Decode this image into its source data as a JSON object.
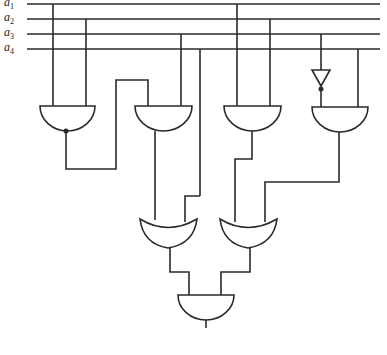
{
  "diagram": {
    "type": "logic-circuit",
    "inputs": [
      {
        "name": "a",
        "sub": "1"
      },
      {
        "name": "a",
        "sub": "2"
      },
      {
        "name": "a",
        "sub": "3"
      },
      {
        "name": "a",
        "sub": "4"
      }
    ],
    "gates": [
      {
        "id": "and1",
        "type": "AND",
        "output_inverted": true,
        "inputs": [
          "a1",
          "a3"
        ]
      },
      {
        "id": "and2",
        "type": "AND",
        "inputs": [
          "and1",
          "a4"
        ]
      },
      {
        "id": "and3",
        "type": "AND",
        "inputs": [
          "a1",
          "a2"
        ]
      },
      {
        "id": "not1",
        "type": "NOT",
        "inputs": [
          "a3"
        ]
      },
      {
        "id": "and4",
        "type": "AND",
        "inputs": [
          "not1",
          "a4"
        ]
      },
      {
        "id": "or1",
        "type": "OR",
        "inputs": [
          "and2",
          "a4"
        ]
      },
      {
        "id": "or2",
        "type": "OR",
        "inputs": [
          "and3",
          "and4"
        ]
      },
      {
        "id": "and5",
        "type": "AND",
        "inputs": [
          "or1",
          "or2"
        ],
        "output": true
      }
    ],
    "colors": {
      "line": "#2a2a2a",
      "background": "#ffffff"
    }
  }
}
